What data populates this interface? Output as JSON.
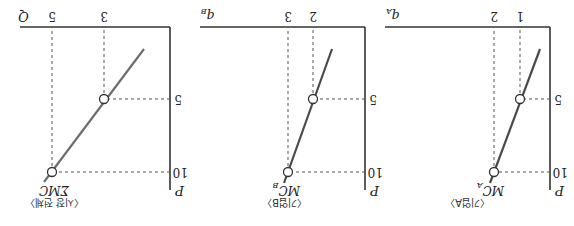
{
  "figure": {
    "orientation": "rotated 180 degrees",
    "panels": [
      {
        "id": "firm-a",
        "caption": "〈기업A〉",
        "x_axis_label": "q",
        "x_axis_sub": "A",
        "y_axis_label": "P",
        "curve_label": "MC",
        "curve_sub": "A",
        "x_ticks": [
          "1",
          "2"
        ],
        "y_ticks": [
          "5",
          "10"
        ],
        "points": [
          {
            "q": 1,
            "P": 5
          },
          {
            "q": 2,
            "P": 10
          }
        ]
      },
      {
        "id": "firm-b",
        "caption": "〈기업B〉",
        "x_axis_label": "q",
        "x_axis_sub": "B",
        "y_axis_label": "P",
        "curve_label": "MC",
        "curve_sub": "B",
        "x_ticks": [
          "2",
          "3"
        ],
        "y_ticks": [
          "5",
          "10"
        ],
        "points": [
          {
            "q": 2,
            "P": 5
          },
          {
            "q": 3,
            "P": 10
          }
        ]
      },
      {
        "id": "market",
        "caption": "〈시장 전체〉",
        "x_axis_label": "Q",
        "x_axis_sub": "",
        "y_axis_label": "P",
        "curve_label": "ΣMC",
        "curve_sub": "",
        "x_ticks": [
          "3",
          "5"
        ],
        "y_ticks": [
          "5",
          "10"
        ],
        "points": [
          {
            "Q": 3,
            "P": 5
          },
          {
            "Q": 5,
            "P": 10
          }
        ]
      }
    ]
  }
}
